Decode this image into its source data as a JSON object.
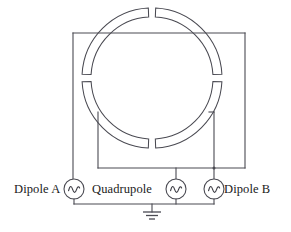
{
  "figure": {
    "type": "circuit-schematic",
    "title": "",
    "background_color": "#ffffff",
    "line_color": "#4a4a52",
    "text_color": "#1a1a1a"
  },
  "labels": {
    "dipole_a": "Dipole A",
    "quadrupole": "Quadrupole",
    "dipole_b": "Dipole B"
  },
  "sources": [
    {
      "name": "source-dipole-a",
      "symbol": "ac-source",
      "glyph": "sine-wave",
      "cx": 74,
      "cy": 189,
      "r": 10
    },
    {
      "name": "source-quadrupole",
      "symbol": "ac-source",
      "glyph": "sine-wave",
      "cx": 176,
      "cy": 189,
      "r": 10
    },
    {
      "name": "source-dipole-b",
      "symbol": "ac-source",
      "glyph": "sine-wave",
      "cx": 214,
      "cy": 189,
      "r": 10
    }
  ],
  "ground": {
    "name": "ground-symbol",
    "x": 152,
    "y": 204
  },
  "electrodes": {
    "count": 4,
    "shape": "ring-arc-segment",
    "center": {
      "x": 152,
      "y": 78
    },
    "outer_radius": 70,
    "inner_radius": 61,
    "segments": [
      {
        "name": "electrode-top-left",
        "start_deg": 183,
        "end_deg": 267
      },
      {
        "name": "electrode-top-right",
        "start_deg": 273,
        "end_deg": 357
      },
      {
        "name": "electrode-bottom-right",
        "start_deg": 3,
        "end_deg": 87
      },
      {
        "name": "electrode-bottom-left",
        "start_deg": 93,
        "end_deg": 177
      }
    ]
  },
  "wires": {
    "outer_loop": "left vertical x=73 from y=33 to y=179; top horizontal y=33 from x=73 to x=245; right vertical x=245 from y=33 to y=179",
    "inner_loop": "left vertical x=98 from y=113 to y=168; bottom horizontal y=168 from x=98 to x=245; right vertical x=214 from y=113 to y=168",
    "ground_rail": "horizontal y=204 from x=74 to x=214"
  }
}
